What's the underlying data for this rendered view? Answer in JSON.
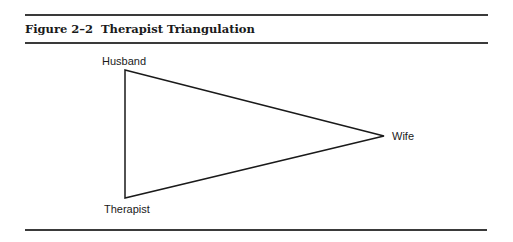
{
  "figure": {
    "number": "Figure 2–2",
    "title": "Therapist Triangulation"
  },
  "diagram": {
    "shape": "triangle",
    "nodes": [
      {
        "id": "husband",
        "label": "Husband",
        "position": "top-left"
      },
      {
        "id": "wife",
        "label": "Wife",
        "position": "right"
      },
      {
        "id": "therapist",
        "label": "Therapist",
        "position": "bottom-left"
      }
    ],
    "edges": [
      {
        "from": "husband",
        "to": "wife"
      },
      {
        "from": "wife",
        "to": "therapist"
      },
      {
        "from": "therapist",
        "to": "husband"
      }
    ],
    "line_color": "#1a1a1a"
  }
}
